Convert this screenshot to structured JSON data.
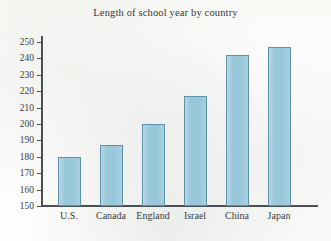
{
  "chart_data": {
    "type": "bar",
    "title": "Length of school year by country",
    "xlabel": "",
    "ylabel": "",
    "categories": [
      "U.S.",
      "Canada",
      "England",
      "Israel",
      "China",
      "Japan"
    ],
    "values": [
      180,
      187,
      200,
      217,
      242,
      247
    ],
    "ylim": [
      150,
      250
    ],
    "ytick_step": 10,
    "yticks": [
      150,
      160,
      170,
      180,
      190,
      200,
      210,
      220,
      230,
      240,
      250
    ],
    "ytick_labels": [
      "150",
      "160",
      "170",
      "180",
      "190",
      "200",
      "210",
      "220",
      "230",
      "240",
      "250"
    ],
    "grid": false,
    "legend": false,
    "bar_fill_color": "#97c7da",
    "bar_border_color": "#5c93ab",
    "axis_color": "#4a4e55",
    "background_color": "#fdfdfb",
    "text_color": "#3b3c3e"
  }
}
